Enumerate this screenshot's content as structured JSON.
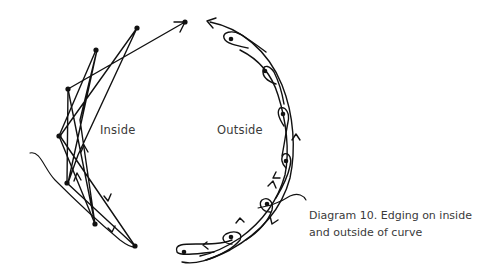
{
  "labels": {
    "inside": "Inside",
    "outside": "Outside"
  },
  "caption": {
    "line1": "Diagram 10. Edging on inside",
    "line2": "and outside of curve"
  },
  "colors": {
    "ink": "#111111",
    "text": "#3a3a3a",
    "background": "#ffffff"
  }
}
